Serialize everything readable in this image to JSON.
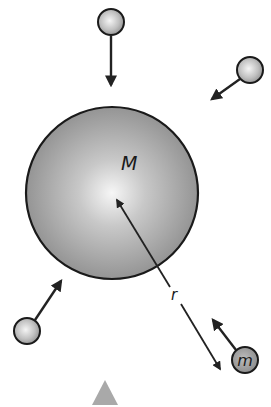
{
  "central_body": {
    "label": "M",
    "center": [
      112,
      193
    ],
    "radius": 86,
    "fill_light": "#f4f4f4",
    "fill_dark": "#8a8a8a",
    "stroke": "#1a1a1a"
  },
  "distance": {
    "label": "r",
    "from": [
      115,
      197
    ],
    "to": [
      222,
      372
    ]
  },
  "small_bodies": [
    {
      "id": "top",
      "label": "",
      "center": [
        111,
        22
      ],
      "radius": 13,
      "arrow_from": [
        111,
        36
      ],
      "arrow_to": [
        111,
        88
      ]
    },
    {
      "id": "top-right",
      "label": "",
      "center": [
        250,
        70
      ],
      "radius": 13,
      "arrow_from": [
        240,
        79
      ],
      "arrow_to": [
        210,
        101
      ]
    },
    {
      "id": "bottom-left",
      "label": "",
      "center": [
        27,
        331
      ],
      "radius": 13,
      "arrow_from": [
        35,
        320
      ],
      "arrow_to": [
        63,
        278
      ]
    },
    {
      "id": "test-mass",
      "label": "m",
      "center": [
        245,
        360
      ],
      "radius": 13,
      "arrow_from": [
        236,
        350
      ],
      "arrow_to": [
        211,
        318
      ]
    }
  ],
  "marker": {
    "shape": "triangle",
    "color": "#a9a9a9",
    "points": [
      [
        105,
        380
      ],
      [
        93,
        405
      ],
      [
        118,
        405
      ]
    ]
  },
  "colors": {
    "ball_light": "#f0f0f0",
    "ball_dark": "#9a9a9a",
    "test_mass_fill": "#a0a0a0",
    "arrow": "#222222"
  }
}
